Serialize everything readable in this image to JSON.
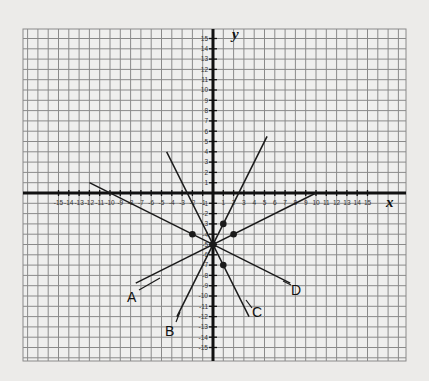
{
  "graph": {
    "x_axis_label": "x",
    "y_axis_label": "y",
    "x_range": [
      -15,
      15
    ],
    "y_range": [
      -15,
      15
    ],
    "x_ticks": [
      "-15",
      "-14",
      "-13",
      "-12",
      "-11",
      "-10",
      "-9",
      "-8",
      "-7",
      "-6",
      "-5",
      "-4",
      "-3",
      "-2",
      "-1",
      "1",
      "2",
      "3",
      "4",
      "5",
      "6",
      "7",
      "8",
      "9",
      "10",
      "11",
      "12",
      "13",
      "14",
      "15"
    ],
    "y_ticks": [
      "15",
      "14",
      "13",
      "12",
      "11",
      "10",
      "9",
      "8",
      "7",
      "6",
      "5",
      "4",
      "3",
      "2",
      "1",
      "-1",
      "-2",
      "-3",
      "-4",
      "-5",
      "-6",
      "-7",
      "-8",
      "-9",
      "-10",
      "-11",
      "-12",
      "-13",
      "-14",
      "-15"
    ],
    "colors": {
      "background": "#ecebe9",
      "grid": "#8a8a8a",
      "axis": "#111111",
      "line": "#1a1a1a"
    }
  },
  "chart_data": {
    "type": "line",
    "title": "",
    "xlabel": "x",
    "ylabel": "y",
    "xlim": [
      -18,
      18
    ],
    "ylim": [
      -16,
      16
    ],
    "grid": true,
    "intersection": {
      "x": 0,
      "y": -5
    },
    "series": [
      {
        "name": "A",
        "equation": "y = 0.5x - 5",
        "x": [
          -7.5,
          10
        ],
        "y": [
          -8.75,
          0
        ],
        "marked_point": {
          "x": 2,
          "y": -4
        }
      },
      {
        "name": "B",
        "equation": "y = 2x - 5",
        "x": [
          -3.5,
          5.25
        ],
        "y": [
          -12,
          5.5
        ],
        "marked_point": {
          "x": 1,
          "y": -3
        }
      },
      {
        "name": "C",
        "equation": "y = -2x - 5",
        "x": [
          -4.5,
          3.5
        ],
        "y": [
          4,
          -12
        ],
        "marked_point": {
          "x": 1,
          "y": -7
        }
      },
      {
        "name": "D",
        "equation": "y = -0.5x - 5",
        "x": [
          -12,
          7.5
        ],
        "y": [
          1,
          -8.75
        ],
        "marked_point": {
          "x": -2,
          "y": -4
        }
      }
    ],
    "labels": [
      "A",
      "B",
      "C",
      "D"
    ]
  },
  "line_labels": {
    "A": "A",
    "B": "B",
    "C": "C",
    "D": "D"
  }
}
